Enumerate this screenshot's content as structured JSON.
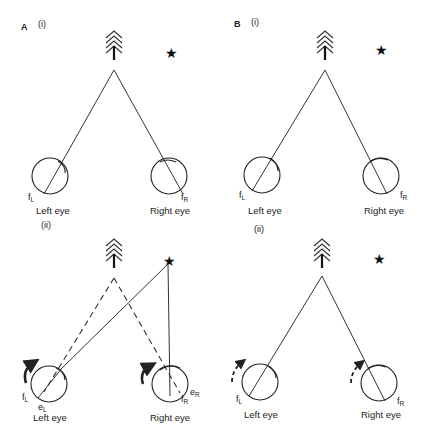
{
  "figure": {
    "panels": [
      {
        "id": "A",
        "letter": "A",
        "sub_i": "(i)",
        "sub_ii": "(ii)",
        "top": {
          "left_eye": "Left eye",
          "right_eye": "Right eye",
          "fL": "f",
          "fL_sub": "L",
          "fR": "f",
          "fR_sub": "R"
        },
        "bottom": {
          "left_eye": "Left eye",
          "right_eye": "Right eye",
          "fL": "f",
          "fL_sub": "L",
          "fR": "f",
          "fR_sub": "R",
          "eL": "e",
          "eL_sub": "L",
          "eR": "e",
          "eR_sub": "R"
        }
      },
      {
        "id": "B",
        "letter": "B",
        "sub_i": "(i)",
        "sub_ii": "(ii)",
        "top": {
          "left_eye": "Left eye",
          "right_eye": "Right eye",
          "fL": "f",
          "fL_sub": "L",
          "fR": "f",
          "fR_sub": "R"
        },
        "bottom": {
          "left_eye": "Left eye",
          "right_eye": "Right eye",
          "fL": "f",
          "fL_sub": "L",
          "fR": "f",
          "fR_sub": "R"
        }
      }
    ],
    "star_glyph": "★",
    "icons": [
      "tree-arrow-icon",
      "star-target-icon",
      "eye-circle-icon",
      "rotation-arrow-icon"
    ],
    "colors": {
      "ink": "#222222",
      "background": "#ffffff"
    }
  }
}
